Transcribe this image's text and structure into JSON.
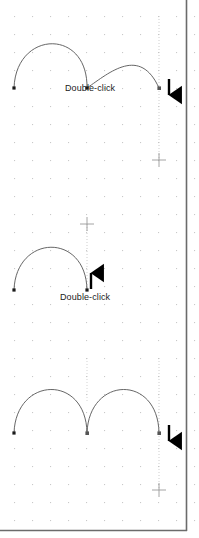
{
  "figure": {
    "width": 199,
    "height": 538,
    "background_color": "#ffffff",
    "frame_color": "#6b6b6b",
    "grid": {
      "type": "dot-grid",
      "dot_color": "#c8c8c8",
      "spacing_px": 18,
      "origin_x": 14,
      "origin_y": 16
    },
    "curve_color": "#555555",
    "anchor_color": "#1a1a1a",
    "guide_color": "#bbbbbb",
    "arrow_color": "#000000"
  },
  "panels": [
    {
      "id": "panel-top",
      "name": "before-double-click",
      "label": "Double-click",
      "label_x": 65,
      "label_y": 83,
      "arrow": {
        "direction": "down",
        "glyph": "arrow-down",
        "x": 169,
        "y": 79,
        "height": 22
      },
      "guide_line": {
        "x": 159,
        "y_top": 16,
        "y_bottom": 160
      },
      "crosshair": {
        "x": 159,
        "y": 160
      },
      "anchors": [
        {
          "x": 14,
          "y": 88
        },
        {
          "x": 87,
          "y": 88
        },
        {
          "x": 159,
          "y": 88
        }
      ],
      "curves": [
        {
          "from": [
            14,
            88
          ],
          "c1": [
            16,
            30
          ],
          "c2": [
            88,
            28
          ],
          "to": [
            87,
            88
          ]
        },
        {
          "from": [
            87,
            88
          ],
          "c1": [
            110,
            72
          ],
          "c2": [
            140,
            46
          ],
          "to": [
            159,
            88
          ]
        }
      ]
    },
    {
      "id": "panel-middle",
      "name": "after-double-click",
      "label": "Double-click",
      "label_x": 60,
      "label_y": 292,
      "arrow": {
        "direction": "up",
        "glyph": "arrow-up",
        "x": 91,
        "y": 267,
        "height": 22
      },
      "guide_line": {
        "x": 87,
        "y_top": 222,
        "y_bottom": 290
      },
      "crosshair": {
        "x": 87,
        "y": 224
      },
      "anchors": [
        {
          "x": 14,
          "y": 290
        },
        {
          "x": 87,
          "y": 290
        }
      ],
      "curves": [
        {
          "from": [
            14,
            290
          ],
          "c1": [
            16,
            234
          ],
          "c2": [
            86,
            232
          ],
          "to": [
            87,
            290
          ]
        }
      ]
    },
    {
      "id": "panel-bottom",
      "name": "result-two-arches",
      "label": "",
      "arrow": {
        "direction": "down",
        "glyph": "arrow-down",
        "x": 169,
        "y": 425,
        "height": 22
      },
      "guide_line": {
        "x": 159,
        "y_top": 358,
        "y_bottom": 490
      },
      "crosshair": {
        "x": 159,
        "y": 490
      },
      "guide_line_secondary": {
        "x": 87,
        "y_top": 358,
        "y_bottom": 400
      },
      "anchors": [
        {
          "x": 14,
          "y": 433
        },
        {
          "x": 87,
          "y": 433
        },
        {
          "x": 159,
          "y": 433
        }
      ],
      "curves": [
        {
          "from": [
            14,
            433
          ],
          "c1": [
            16,
            376
          ],
          "c2": [
            86,
            374
          ],
          "to": [
            87,
            433
          ]
        },
        {
          "from": [
            87,
            433
          ],
          "c1": [
            89,
            376
          ],
          "c2": [
            158,
            374
          ],
          "to": [
            159,
            433
          ]
        }
      ]
    }
  ],
  "icons": {
    "arrow_down": "arrow-down-icon",
    "arrow_up": "arrow-up-icon",
    "crosshair": "crosshair-icon",
    "anchor_point": "anchor-point-icon"
  }
}
